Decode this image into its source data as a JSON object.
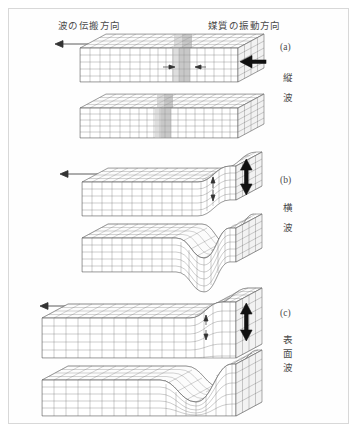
{
  "figure": {
    "type": "seismic-wave-diagram",
    "background_color": "#ffffff",
    "border_color": "#d8d8d8",
    "mesh_color": "#6f6f6f",
    "accent_color": "#111111",
    "headers": {
      "propagation": "波の伝搬方向",
      "vibration": "媒質の振動方向"
    },
    "panels": [
      {
        "tag": "(a)",
        "name_chars": [
          "縦",
          "波"
        ],
        "wave_type": "longitudinal",
        "propagation_arrow": "left",
        "vibration_arrow": "horizontal",
        "snapshots": 2,
        "feature": "compression-band"
      },
      {
        "tag": "(b)",
        "name_chars": [
          "横",
          "波"
        ],
        "wave_type": "transverse",
        "propagation_arrow": "left",
        "vibration_arrow": "vertical",
        "snapshots": 2,
        "feature": "shear-offset"
      },
      {
        "tag": "(c)",
        "name_chars": [
          "表",
          "面",
          "波"
        ],
        "wave_type": "surface",
        "propagation_arrow": "left",
        "vibration_arrow": "vertical-elliptical",
        "snapshots": 2,
        "feature": "rayleigh-hump"
      }
    ]
  }
}
